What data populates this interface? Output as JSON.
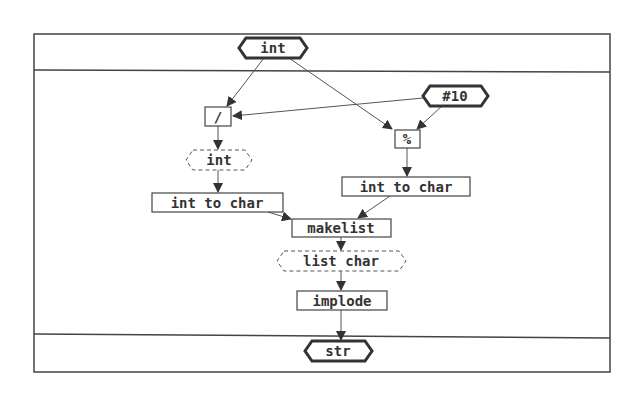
{
  "diagram": {
    "type": "dataflow",
    "input": {
      "label": "int",
      "shape": "hexagon"
    },
    "output": {
      "label": "str",
      "shape": "hexagon"
    },
    "constant": {
      "label": "#10",
      "shape": "hexagon"
    },
    "nodes": {
      "divide": {
        "label": "/",
        "shape": "box"
      },
      "modulo": {
        "label": "%",
        "shape": "box"
      },
      "int_intermediate": {
        "label": "int",
        "shape": "dashed-hexagon"
      },
      "int_to_char_left": {
        "label": "int to char",
        "shape": "box"
      },
      "int_to_char_right": {
        "label": "int to char",
        "shape": "box"
      },
      "makelist": {
        "label": "makelist",
        "shape": "box"
      },
      "list_char": {
        "label": "list char",
        "shape": "dashed-hexagon"
      },
      "implode": {
        "label": "implode",
        "shape": "box"
      }
    },
    "edges": [
      {
        "from": "int",
        "to": "/"
      },
      {
        "from": "int",
        "to": "%"
      },
      {
        "from": "#10",
        "to": "/"
      },
      {
        "from": "#10",
        "to": "%"
      },
      {
        "from": "/",
        "to": "int"
      },
      {
        "from": "int",
        "to": "int to char (left)"
      },
      {
        "from": "%",
        "to": "int to char (right)"
      },
      {
        "from": "int to char (left)",
        "to": "makelist"
      },
      {
        "from": "int to char (right)",
        "to": "makelist"
      },
      {
        "from": "makelist",
        "to": "list char"
      },
      {
        "from": "list char",
        "to": "implode"
      },
      {
        "from": "implode",
        "to": "str"
      }
    ],
    "colors": {
      "stroke": "#333333",
      "background": "#ffffff"
    }
  }
}
